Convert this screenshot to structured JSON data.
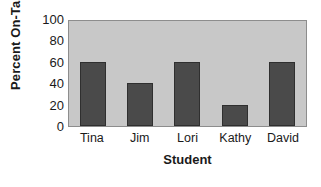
{
  "chart_data": {
    "type": "bar",
    "title": "",
    "categories": [
      "Tina",
      "Jim",
      "Lori",
      "Kathy",
      "David"
    ],
    "values": [
      60,
      40,
      60,
      20,
      60
    ],
    "xlabel": "Student",
    "ylabel": "Percent On-Task",
    "ylim": [
      0,
      100
    ],
    "ytick_labels": [
      "100",
      "80",
      "60",
      "40",
      "20",
      "0"
    ],
    "ytick_values": [
      100,
      80,
      60,
      40,
      20,
      0
    ],
    "grid": false,
    "legend": "none",
    "colors": {
      "bar_fill": "#4a4a4a",
      "bar_border": "#2f2f2f",
      "plot_background": "#c8c8c8",
      "plot_border": "#8d8d8d",
      "text": "#1a1a1a",
      "figure_background": "#ffffff"
    }
  }
}
